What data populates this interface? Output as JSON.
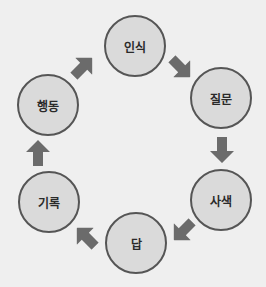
{
  "diagram": {
    "type": "cycle",
    "colors": {
      "background": "#efefef",
      "node_fill": "#dadada",
      "node_border": "#555555",
      "arrow": "#6b6b6b",
      "text": "#2a2a2a"
    },
    "nodes": [
      {
        "id": "recognition",
        "label": "인식"
      },
      {
        "id": "question",
        "label": "질문"
      },
      {
        "id": "reflection",
        "label": "사색"
      },
      {
        "id": "answer",
        "label": "답"
      },
      {
        "id": "record",
        "label": "기록"
      },
      {
        "id": "action",
        "label": "행동"
      }
    ],
    "edges": [
      {
        "from": "인식",
        "to": "질문",
        "direction": "down-right"
      },
      {
        "from": "질문",
        "to": "사색",
        "direction": "down"
      },
      {
        "from": "사색",
        "to": "답",
        "direction": "down-left"
      },
      {
        "from": "답",
        "to": "기록",
        "direction": "up-left"
      },
      {
        "from": "기록",
        "to": "행동",
        "direction": "up"
      },
      {
        "from": "행동",
        "to": "인식",
        "direction": "up-right"
      }
    ]
  }
}
